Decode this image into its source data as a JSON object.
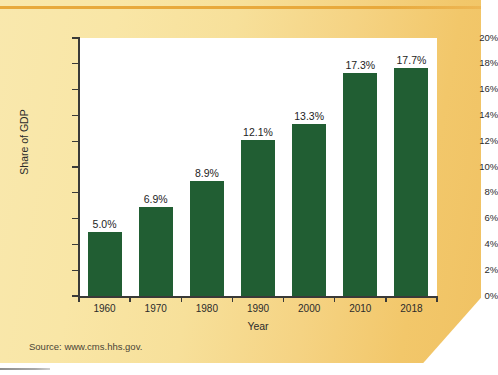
{
  "figure": {
    "background_left_color": "#f9e8ad",
    "background_right_color": "#f0c263",
    "top_rule_color": "#e8a93c",
    "plot_background_color": "#ffffff",
    "bar_color": "#215e33",
    "axis_color": "#3a3a38"
  },
  "source": {
    "text": "Source: www.cms.hhs.gov."
  },
  "chart_data": {
    "type": "bar",
    "title": "",
    "xlabel": "Year",
    "ylabel": "Share of GDP",
    "categories": [
      "1960",
      "1970",
      "1980",
      "1990",
      "2000",
      "2010",
      "2018"
    ],
    "values": [
      5.0,
      6.9,
      8.9,
      12.1,
      13.3,
      17.3,
      17.7
    ],
    "data_labels": [
      "5.0%",
      "6.9%",
      "8.9%",
      "12.1%",
      "13.3%",
      "17.3%",
      "17.7%"
    ],
    "ylim": [
      0,
      20
    ],
    "ytick_values": [
      0,
      2,
      4,
      6,
      8,
      10,
      12,
      14,
      16,
      18,
      20
    ],
    "ytick_labels": [
      "0%",
      "2%",
      "4%",
      "6%",
      "8%",
      "10%",
      "12%",
      "14%",
      "16%",
      "18%",
      "20%"
    ],
    "grid": false,
    "legend": null,
    "series_color": "#215e33"
  }
}
